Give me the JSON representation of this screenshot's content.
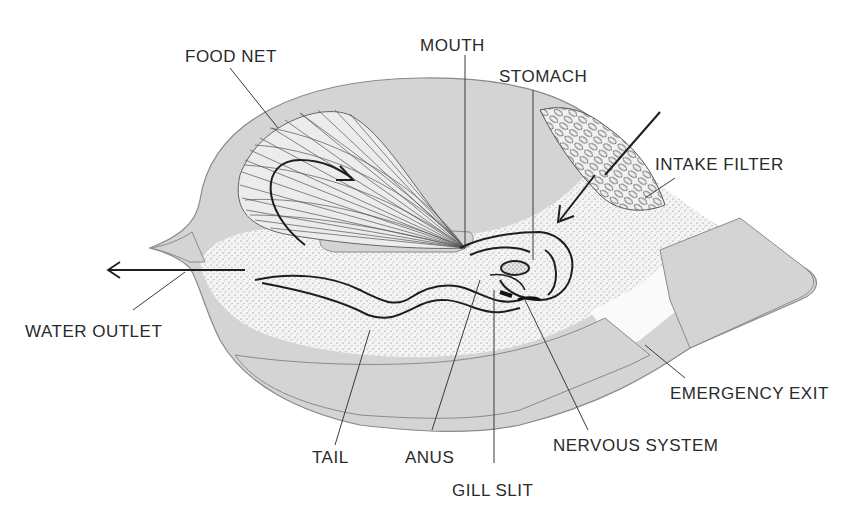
{
  "figure": {
    "colors": {
      "house_fill": "#d4d4d4",
      "house_stroke": "#8a8a8a",
      "stipple_zone": "#efefef",
      "outline": "#1e1e1e",
      "leader_line": "#3a3a3a",
      "background": "#ffffff"
    }
  },
  "labels": {
    "food_net": "FOOD NET",
    "mouth": "MOUTH",
    "stomach": "STOMACH",
    "intake_filter": "INTAKE FILTER",
    "water_outlet": "WATER OUTLET",
    "emergency_exit": "EMERGENCY EXIT",
    "tail": "TAIL",
    "anus": "ANUS",
    "gill_slit": "GILL SLIT",
    "nervous_system": "NERVOUS SYSTEM"
  },
  "arrows": [
    {
      "name": "water-outflow-arrow",
      "direction": "left"
    },
    {
      "name": "water-inflow-arrow",
      "direction": "down-left"
    },
    {
      "name": "food-net-circulation-arrow",
      "direction": "clockwise"
    }
  ]
}
